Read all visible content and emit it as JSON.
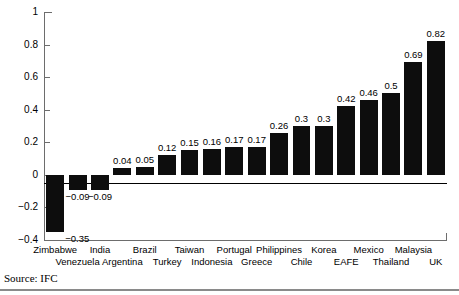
{
  "figure": {
    "source_note": "Source: IFC",
    "axis_color": "#6d6d6d",
    "bar_color": "#0d0d0d"
  },
  "chart_data": {
    "type": "bar",
    "title": "",
    "xlabel": "",
    "ylabel": "",
    "ylim": [
      -0.4,
      1
    ],
    "yticks": [
      -0.4,
      -0.2,
      0,
      0.2,
      0.4,
      0.6,
      0.8,
      1
    ],
    "ytick_labels": [
      "−0.4",
      "−0.2",
      "0",
      "0.2",
      "0.4",
      "0.6",
      "0.8",
      "1"
    ],
    "grid": false,
    "legend": "none",
    "zero_line": true,
    "categories": [
      "Zimbabwe",
      "Venezuela",
      "India",
      "Argentina",
      "Brazil",
      "Turkey",
      "Taiwan",
      "Indonesia",
      "Portugal",
      "Greece",
      "Philippines",
      "Chile",
      "Korea",
      "EAFE",
      "Mexico",
      "Thailand",
      "Malaysia",
      "UK"
    ],
    "values": [
      -0.35,
      -0.09,
      -0.09,
      0.04,
      0.05,
      0.12,
      0.15,
      0.16,
      0.17,
      0.17,
      0.26,
      0.3,
      0.3,
      0.42,
      0.46,
      0.5,
      0.69,
      0.82
    ],
    "value_labels": [
      "−0.35",
      "−0.09",
      "−0.09",
      "0.04",
      "0.05",
      "0.12",
      "0.15",
      "0.16",
      "0.17",
      "0.17",
      "0.26",
      "0.3",
      "0.3",
      "0.42",
      "0.46",
      "0.5",
      "0.69",
      "0.82"
    ]
  }
}
